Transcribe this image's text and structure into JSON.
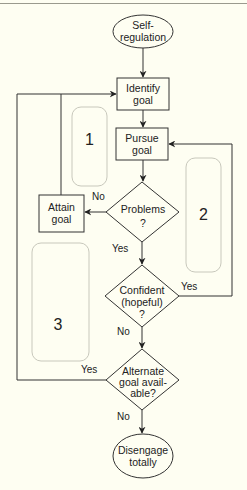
{
  "diagram": {
    "type": "flowchart",
    "colors": {
      "background": "#fefef2",
      "stroke": "#333333",
      "region_stroke": "#c8c8bc"
    },
    "nodes": {
      "start": {
        "shape": "ellipse",
        "line1": "Self-",
        "line2": "regulation"
      },
      "identify": {
        "shape": "rect",
        "line1": "Identify",
        "line2": "goal"
      },
      "pursue": {
        "shape": "rect",
        "line1": "Pursue",
        "line2": "goal"
      },
      "problems": {
        "shape": "diamond",
        "line1": "Problems",
        "line2": "?"
      },
      "attain": {
        "shape": "rect",
        "line1": "Attain",
        "line2": "goal"
      },
      "confident": {
        "shape": "diamond",
        "line1": "Confident",
        "line2": "(hopeful)",
        "line3": "?"
      },
      "alternate": {
        "shape": "diamond",
        "line1": "Alternate",
        "line2": "goal avail-",
        "line3": "able?"
      },
      "disengage": {
        "shape": "ellipse",
        "line1": "Disengage",
        "line2": "totally"
      }
    },
    "edge_labels": {
      "problems_no": "No",
      "problems_yes": "Yes",
      "confident_yes": "Yes",
      "confident_no": "No",
      "alternate_yes": "Yes",
      "alternate_no": "No"
    },
    "regions": [
      {
        "label": "1"
      },
      {
        "label": "2"
      },
      {
        "label": "3"
      }
    ],
    "edges": [
      {
        "from": "start",
        "to": "identify"
      },
      {
        "from": "identify",
        "to": "pursue"
      },
      {
        "from": "pursue",
        "to": "problems"
      },
      {
        "from": "problems",
        "to": "attain",
        "label": "No"
      },
      {
        "from": "problems",
        "to": "confident",
        "label": "Yes"
      },
      {
        "from": "attain",
        "to": "identify"
      },
      {
        "from": "confident",
        "to": "pursue",
        "label": "Yes"
      },
      {
        "from": "confident",
        "to": "alternate",
        "label": "No"
      },
      {
        "from": "alternate",
        "to": "identify",
        "label": "Yes"
      },
      {
        "from": "alternate",
        "to": "disengage",
        "label": "No"
      }
    ]
  }
}
